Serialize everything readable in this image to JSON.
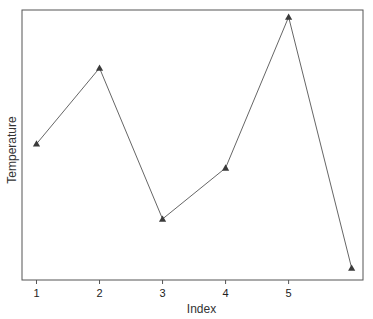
{
  "chart_data": {
    "type": "line",
    "title": "",
    "xlabel": "Index",
    "ylabel": "Temperature",
    "x": [
      1,
      2,
      3,
      4,
      5,
      6
    ],
    "xticks": [
      1,
      2,
      3,
      4,
      5
    ],
    "xtick_labels": [
      "1",
      "2",
      "3",
      "4",
      "5"
    ],
    "xlim": [
      0.77,
      6.18
    ],
    "yticks": [],
    "ylim": [
      0,
      100
    ],
    "y_note": "No y-axis tick labels shown; values are relative heights on a 0-100 scale of the plot area",
    "series": [
      {
        "name": "Temperature",
        "values": [
          50.4,
          78.5,
          22.6,
          41.5,
          97.4,
          4.4
        ],
        "marker": "triangle",
        "color": "#555555"
      }
    ],
    "grid": false,
    "legend": null
  },
  "plot": {
    "left": 22,
    "top": 10,
    "right": 363,
    "bottom": 280,
    "line_color": "#666666",
    "marker_color": "#3a3a3a",
    "frame_color": "#555555"
  }
}
